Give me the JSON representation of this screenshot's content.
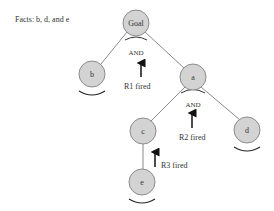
{
  "facts_label": "Facts: b, d, and e",
  "nodes": {
    "goal": {
      "label": "Goal",
      "x": 136,
      "y": 23
    },
    "b": {
      "label": "b",
      "x": 92,
      "y": 74
    },
    "a": {
      "label": "a",
      "x": 193,
      "y": 77
    },
    "c": {
      "label": "c",
      "x": 143,
      "y": 131
    },
    "d": {
      "label": "d",
      "x": 247,
      "y": 130
    },
    "e": {
      "label": "e",
      "x": 142,
      "y": 182
    }
  },
  "and_labels": {
    "goal_and": "AND",
    "a_and": "AND"
  },
  "rules": {
    "r1": "R1 fired",
    "r2": "R2 fired",
    "r3": "R3 fired"
  },
  "colors": {
    "node_fill": "#d3d3d3",
    "node_stroke": "#8c8c8c",
    "edge": "#888888",
    "text": "#333333"
  }
}
